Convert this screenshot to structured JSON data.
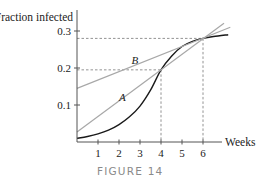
{
  "chart_data": {
    "type": "line",
    "caption": "FIGURE 14",
    "ylabel": "Fraction infected",
    "xlabel": "Weeks",
    "xlim": [
      0,
      7.2
    ],
    "ylim": [
      0,
      0.3
    ],
    "x_ticks": [
      1,
      2,
      3,
      4,
      5,
      6
    ],
    "x_tick_labels": [
      "1",
      "2",
      "3",
      "4",
      "5",
      "6"
    ],
    "y_ticks": [
      0.1,
      0.2,
      0.3
    ],
    "y_tick_labels": [
      "0.1",
      "0.2",
      "0.3"
    ],
    "grid": false,
    "series": [
      {
        "name": "infection curve",
        "style": "solid-black",
        "x": [
          0,
          0.5,
          1,
          1.5,
          2,
          2.5,
          3,
          3.5,
          4,
          4.5,
          5,
          5.5,
          6,
          6.5,
          7.2
        ],
        "y": [
          0.01,
          0.015,
          0.022,
          0.032,
          0.047,
          0.068,
          0.097,
          0.14,
          0.195,
          0.232,
          0.258,
          0.272,
          0.28,
          0.285,
          0.29
        ]
      },
      {
        "name": "A",
        "style": "solid-gray",
        "x": [
          0,
          7.0
        ],
        "y": [
          0.027,
          0.321
        ]
      },
      {
        "name": "B",
        "style": "solid-gray",
        "x": [
          0,
          7.3
        ],
        "y": [
          0.145,
          0.31
        ]
      }
    ],
    "line_labels": [
      {
        "text": "A",
        "x": 2.0,
        "y": 0.11
      },
      {
        "text": "B",
        "x": 2.6,
        "y": 0.21
      }
    ],
    "reference_lines": [
      {
        "x": 4,
        "y": 0.195
      },
      {
        "x": 6,
        "y": 0.28
      }
    ]
  }
}
